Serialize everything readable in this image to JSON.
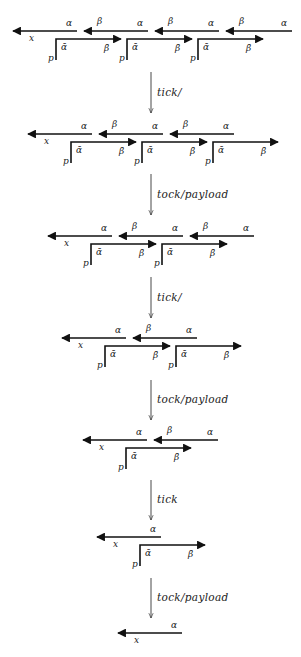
{
  "diagram": {
    "title": "",
    "labels": {
      "alpha": "α",
      "beta": "β",
      "alpha_bar": "ᾱ",
      "beta_bar": "β̄",
      "x": "x",
      "p": "p"
    },
    "transition_x": 151,
    "rows": [
      {
        "y": 31,
        "x_arrow_start": 13,
        "segments": 4,
        "brackets": 3
      },
      {
        "y": 134,
        "x_arrow_start": 28,
        "segments": 3,
        "brackets": 3
      },
      {
        "y": 236,
        "x_arrow_start": 48,
        "segments": 3,
        "brackets": 2
      },
      {
        "y": 338,
        "x_arrow_start": 62,
        "segments": 2,
        "brackets": 2
      },
      {
        "y": 440,
        "x_arrow_start": 83,
        "segments": 2,
        "brackets": 1
      },
      {
        "y": 537,
        "x_arrow_start": 97,
        "segments": 1,
        "brackets": 1
      },
      {
        "y": 633,
        "x_arrow_start": 118,
        "segments": 1,
        "brackets": 0
      }
    ],
    "transitions": [
      {
        "label": "tick/",
        "y1": 72,
        "y2": 113
      },
      {
        "label": "tock/payload",
        "y1": 174,
        "y2": 215
      },
      {
        "label": "tick/",
        "y1": 277,
        "y2": 318
      },
      {
        "label": "tock/payload",
        "y1": 380,
        "y2": 420
      },
      {
        "label": "tick",
        "y1": 480,
        "y2": 520
      },
      {
        "label": "tock/payload",
        "y1": 578,
        "y2": 618
      }
    ]
  }
}
